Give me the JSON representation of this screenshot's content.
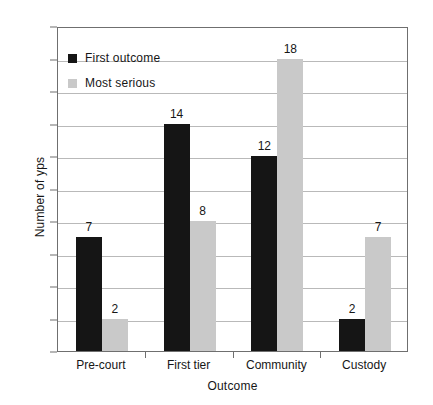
{
  "chart_data": {
    "type": "bar",
    "title": "",
    "xlabel": "Outcome",
    "ylabel": "Number of yps",
    "ylim": [
      0,
      20
    ],
    "ytick_step": 2,
    "yticks": [
      0,
      2,
      4,
      6,
      8,
      10,
      12,
      14,
      16,
      18,
      20
    ],
    "grid": true,
    "legend_position": "upper left inside",
    "categories": [
      "Pre-court",
      "First tier",
      "Community",
      "Custody"
    ],
    "series": [
      {
        "name": "First outcome",
        "color": "#151515",
        "values": [
          7,
          14,
          12,
          2
        ]
      },
      {
        "name": "Most serious",
        "color": "#c9c9c9",
        "values": [
          2,
          8,
          18,
          7
        ]
      }
    ],
    "data_labels": [
      {
        "category": "Pre-court",
        "series": "First outcome",
        "value": "7"
      },
      {
        "category": "Pre-court",
        "series": "Most serious",
        "value": "2"
      },
      {
        "category": "First tier",
        "series": "First outcome",
        "value": "14"
      },
      {
        "category": "First tier",
        "series": "Most serious",
        "value": "8"
      },
      {
        "category": "Community",
        "series": "First outcome",
        "value": "12"
      },
      {
        "category": "Community",
        "series": "Most serious",
        "value": "18"
      },
      {
        "category": "Custody",
        "series": "First outcome",
        "value": "2"
      },
      {
        "category": "Custody",
        "series": "Most serious",
        "value": "7"
      }
    ]
  },
  "colors": {
    "first_outcome": "#151515",
    "most_serious": "#c9c9c9",
    "axis": "#6f6f6f",
    "gridline": "#b9b9b9",
    "background": "#ffffff",
    "text": "#161616"
  }
}
